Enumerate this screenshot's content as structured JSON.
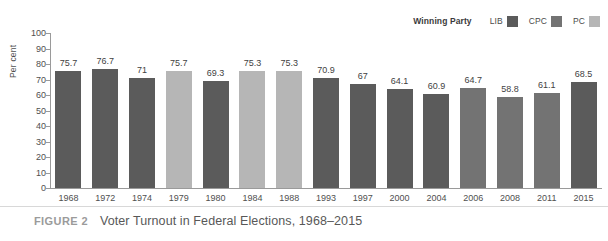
{
  "figure": {
    "label": "FIGURE 2",
    "caption": "Voter Turnout in Federal Elections, 1968–2015"
  },
  "legend": {
    "title": "Winning Party",
    "entries": [
      {
        "label": "LIB",
        "color": "#5b5b5b"
      },
      {
        "label": "CPC",
        "color": "#737373"
      },
      {
        "label": "PC",
        "color": "#b6b6b6"
      }
    ]
  },
  "axes": {
    "ylabel": "Per cent",
    "yticks": [
      "0",
      "10",
      "20",
      "30",
      "40",
      "50",
      "60",
      "70",
      "80",
      "90",
      "100"
    ]
  },
  "chart_data": {
    "type": "bar",
    "title": "Voter Turnout in Federal Elections, 1968–2015",
    "xlabel": "",
    "ylabel": "Per cent",
    "ylim": [
      0,
      100
    ],
    "ytick_step": 10,
    "grid": false,
    "legend_position": "top-right",
    "legend_title": "Winning Party",
    "categories": [
      "1968",
      "1972",
      "1974",
      "1979",
      "1980",
      "1984",
      "1988",
      "1993",
      "1997",
      "2000",
      "2004",
      "2006",
      "2008",
      "2011",
      "2015"
    ],
    "values": [
      75.7,
      76.7,
      71,
      75.7,
      69.3,
      75.3,
      75.3,
      70.9,
      67,
      64.1,
      60.9,
      64.7,
      58.8,
      61.1,
      68.5
    ],
    "value_labels": [
      "75.7",
      "76.7",
      "71",
      "75.7",
      "69.3",
      "75.3",
      "75.3",
      "70.9",
      "67",
      "64.1",
      "60.9",
      "64.7",
      "58.8",
      "61.1",
      "68.5"
    ],
    "point_groups": [
      "LIB",
      "LIB",
      "LIB",
      "PC",
      "LIB",
      "PC",
      "PC",
      "LIB",
      "LIB",
      "LIB",
      "LIB",
      "CPC",
      "CPC",
      "CPC",
      "LIB"
    ],
    "group_colors": {
      "LIB": "#5b5b5b",
      "CPC": "#737373",
      "PC": "#b6b6b6"
    },
    "series": [
      {
        "name": "Voter turnout",
        "values": [
          75.7,
          76.7,
          71,
          75.7,
          69.3,
          75.3,
          75.3,
          70.9,
          67,
          64.1,
          60.9,
          64.7,
          58.8,
          61.1,
          68.5
        ]
      }
    ]
  }
}
